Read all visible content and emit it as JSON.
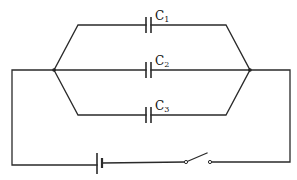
{
  "diagram": {
    "type": "circuit",
    "capacitors": [
      {
        "label": "C",
        "subscript": "1",
        "branch": "top"
      },
      {
        "label": "C",
        "subscript": "2",
        "branch": "middle"
      },
      {
        "label": "C",
        "subscript": "3",
        "branch": "bottom"
      }
    ],
    "components": {
      "battery": {
        "symbol": "cell",
        "position": "bottom-left"
      },
      "switch": {
        "state": "open",
        "position": "bottom-right"
      }
    },
    "colors": {
      "wire": "#2a2a2a",
      "background": "#ffffff"
    }
  }
}
